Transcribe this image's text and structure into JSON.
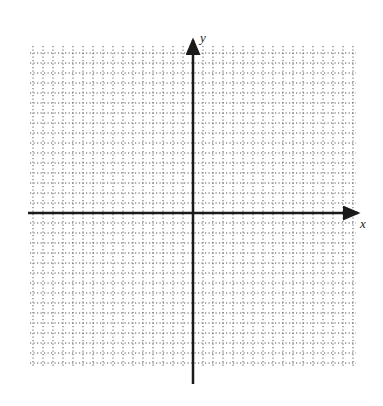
{
  "diagram": {
    "type": "coordinate-plane",
    "axes": {
      "x_label": "x",
      "y_label": "y"
    },
    "grid": {
      "style": "dotted",
      "spacing_px": 10,
      "x_start": 30,
      "x_end": 356,
      "y_start": 46,
      "y_end": 368
    },
    "origin_px": {
      "x": 193,
      "y": 213
    },
    "colors": {
      "grid": "#555555",
      "axis": "#1a1a1a",
      "background": "#ffffff"
    }
  }
}
